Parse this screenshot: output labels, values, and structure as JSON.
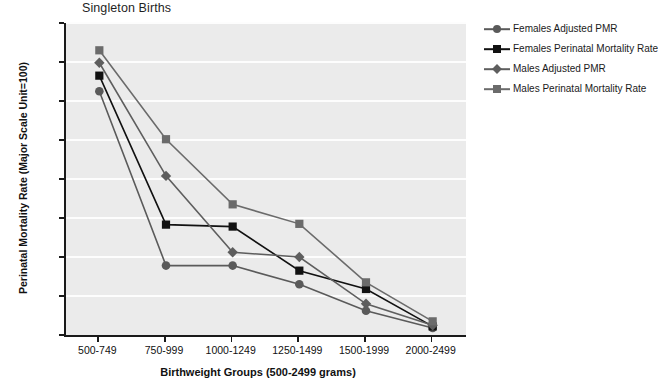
{
  "chart_data": {
    "type": "line",
    "title": "Singleton Births",
    "xlabel": "Birthweight Groups (500-2499 grams)",
    "ylabel": "Perinatal Mortality Rate (Major Scale Unit=100)",
    "categories": [
      "500-749",
      "750-999",
      "1000-1249",
      "1250-1499",
      "1500-1999",
      "2000-2499"
    ],
    "ylim": [
      0,
      800
    ],
    "yticks": [
      0,
      100,
      200,
      300,
      400,
      500,
      600,
      700,
      800
    ],
    "grid": true,
    "legend_position": "right",
    "series": [
      {
        "name": "Females Adjusted PMR",
        "marker": "circle",
        "color": "#5a5a5a",
        "values": [
          625,
          178,
          178,
          130,
          62,
          18
        ]
      },
      {
        "name": "Females Perinatal Mortality Rate",
        "marker": "square",
        "color": "#111111",
        "values": [
          665,
          283,
          278,
          165,
          118,
          22
        ]
      },
      {
        "name": "Males Adjusted PMR",
        "marker": "diamond",
        "color": "#5e5e5e",
        "values": [
          698,
          408,
          212,
          200,
          80,
          25
        ]
      },
      {
        "name": "Males Perinatal Mortality Rate",
        "marker": "square",
        "color": "#6b6b6b",
        "values": [
          730,
          502,
          335,
          285,
          135,
          35
        ]
      }
    ]
  },
  "legend": {
    "items": [
      {
        "label": "Females Adjusted PMR"
      },
      {
        "label": "Females Perinatal Mortality Rate"
      },
      {
        "label": "Males Adjusted PMR"
      },
      {
        "label": "Males Perinatal Mortality Rate"
      }
    ]
  }
}
